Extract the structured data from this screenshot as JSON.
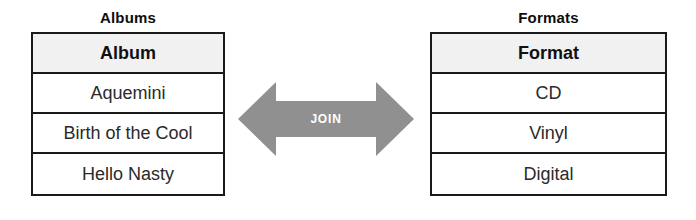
{
  "diagram": {
    "type": "join-diagram",
    "left_table": {
      "title": "Albums",
      "column_header": "Album",
      "rows": [
        "Aquemini",
        "Birth of the Cool",
        "Hello Nasty"
      ]
    },
    "right_table": {
      "title": "Formats",
      "column_header": "Format",
      "rows": [
        "CD",
        "Vinyl",
        "Digital"
      ]
    },
    "connector": {
      "label": "JOIN",
      "icon": "double-arrow-icon",
      "color": "#909090",
      "label_color": "#ffffff"
    },
    "colors": {
      "border": "#1a1a1a",
      "header_fill": "#f1f1f1",
      "cell_fill": "#ffffff",
      "text": "#2a2a2a",
      "background": "#ffffff"
    }
  }
}
